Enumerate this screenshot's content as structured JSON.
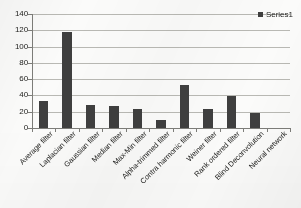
{
  "chart_data": {
    "type": "bar",
    "title": "",
    "subtitle": "",
    "xlabel": "",
    "ylabel": "",
    "ylim": [
      0,
      140
    ],
    "ytick_step": 20,
    "yticks": [
      140,
      120,
      100,
      80,
      60,
      40,
      20,
      0
    ],
    "grid": true,
    "legend_position": "top-right",
    "series": [
      {
        "name": "Series1",
        "color": "#3f3f3f",
        "values": [
          33,
          118,
          28,
          27,
          23,
          10,
          53,
          23,
          39,
          18,
          0
        ]
      }
    ],
    "categories": [
      "Average filter",
      "Laplacian filter",
      "Gaussian filter",
      "Median filter",
      "Max-Min filter",
      "Alpha-trimmed filter",
      "Contra harmonic filter",
      "Weiner filter",
      "Rank ordered filter",
      "Blind Deconvolution",
      "Neural network"
    ]
  },
  "legend": {
    "entries": [
      {
        "label": "Series1",
        "color": "#3f3f3f"
      }
    ]
  },
  "colors": {
    "bar": "#3f3f3f",
    "grid": "#b9b9b4",
    "axis": "#7d7d79",
    "text": "#1d1d1b",
    "background": "#fbfbfa"
  }
}
